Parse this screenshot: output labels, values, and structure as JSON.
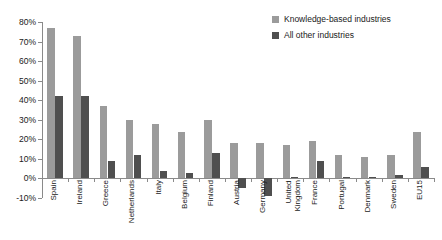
{
  "chart_data": {
    "type": "bar",
    "title": "",
    "subtitle": "",
    "xlabel": "",
    "ylabel": "",
    "ylim": [
      -10,
      80
    ],
    "ytick_step": 10,
    "grid": false,
    "legend_position": "top-right",
    "categories": [
      "Spain",
      "Ireland",
      "Greece",
      "Netherlands",
      "Italy",
      "Belgium",
      "Finland",
      "Austria",
      "Germany",
      "United\nKingdom",
      "France",
      "Portugal",
      "Denmark",
      "Sweden",
      "EU15"
    ],
    "ytick_labels": [
      "80%",
      "70%",
      "60%",
      "50%",
      "40%",
      "30%",
      "20%",
      "10%",
      "0%",
      "-10%"
    ],
    "ytick_values": [
      80,
      70,
      60,
      50,
      40,
      30,
      20,
      10,
      0,
      -10
    ],
    "series": [
      {
        "name": "Knowledge-based industries",
        "color": "#9b9b9b",
        "values": [
          77,
          73,
          37,
          30,
          28,
          24,
          30,
          18,
          18,
          17,
          19,
          12,
          11,
          12,
          24
        ]
      },
      {
        "name": "All other industries",
        "color": "#4f4f4f",
        "values": [
          42,
          42,
          9,
          12,
          4,
          3,
          13,
          -5,
          -9,
          1,
          9,
          1,
          0.5,
          2,
          6
        ]
      }
    ]
  },
  "legend": {
    "items": [
      {
        "label": "Knowledge-based industries",
        "color": "#9b9b9b"
      },
      {
        "label": "All other industries",
        "color": "#4f4f4f"
      }
    ]
  }
}
